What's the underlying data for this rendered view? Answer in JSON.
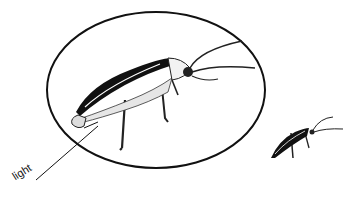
{
  "diagram": {
    "labels": [
      {
        "text": "light",
        "points_to": "abdomen-light-organ"
      }
    ],
    "elements": [
      "magnified-firefly-in-ellipse",
      "small-firefly-actual-size"
    ],
    "colors": {
      "ink": "#111111",
      "background": "#ffffff"
    }
  }
}
